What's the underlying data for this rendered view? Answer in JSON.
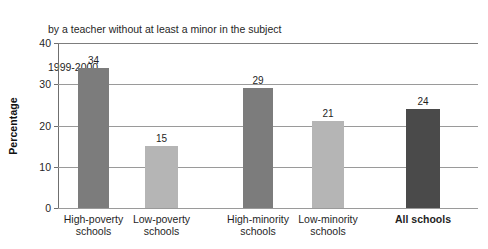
{
  "title": {
    "line1": "by a teacher without at least a minor in the subject",
    "line2": "1999-2000"
  },
  "axes": {
    "y_title": "Percentage",
    "y_ticks": [
      "40",
      "30",
      "20",
      "10",
      "0"
    ]
  },
  "chart_data": {
    "type": "bar",
    "title": "by a teacher without at least a minor in the subject 1999-2000",
    "subtitle": "1999-2000",
    "xlabel": "",
    "ylabel": "Percentage",
    "ylim": [
      0,
      40
    ],
    "yticks": [
      0,
      10,
      20,
      30,
      40
    ],
    "grid": true,
    "legend": "none",
    "categories": [
      "High-poverty schools",
      "Low-poverty schools",
      "High-minority schools",
      "Low-minority schools",
      "All schools"
    ],
    "values": [
      34,
      15,
      29,
      21,
      24
    ],
    "value_labels": [
      "34",
      "15",
      "29",
      "21",
      "24"
    ],
    "bar_colors": [
      "#7c7c7c",
      "#b5b5b5",
      "#7c7c7c",
      "#b5b5b5",
      "#4a4a4a"
    ],
    "bars": [
      {
        "label_line1": "High-poverty",
        "label_line2": "schools",
        "value": 34,
        "value_label": "34",
        "color": "#7c7c7c",
        "left": 20,
        "width": 31,
        "emphasis": false
      },
      {
        "label_line1": "Low-poverty",
        "label_line2": "schools",
        "value": 15,
        "value_label": "15",
        "color": "#b5b5b5",
        "left": 87,
        "width": 33,
        "emphasis": false
      },
      {
        "label_line1": "High-minority",
        "label_line2": "schools",
        "value": 29,
        "value_label": "29",
        "color": "#7c7c7c",
        "left": 185,
        "width": 30,
        "emphasis": false
      },
      {
        "label_line1": "Low-minority",
        "label_line2": "schools",
        "value": 21,
        "value_label": "21",
        "color": "#b5b5b5",
        "left": 254,
        "width": 32,
        "emphasis": false
      },
      {
        "label_line1": "All schools",
        "label_line2": "",
        "value": 24,
        "value_label": "24",
        "color": "#4a4a4a",
        "left": 348,
        "width": 34,
        "emphasis": true
      }
    ]
  }
}
